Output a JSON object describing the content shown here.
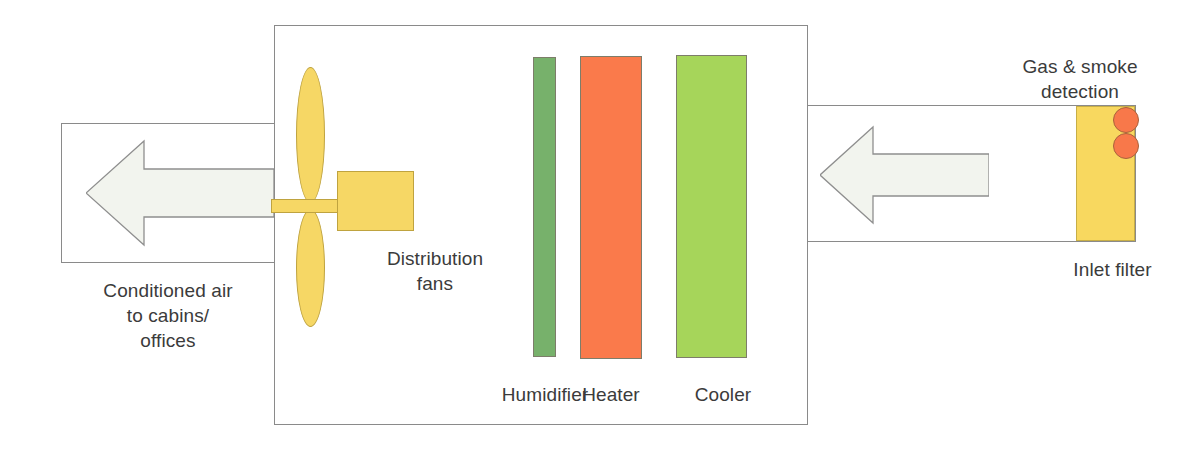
{
  "diagram": {
    "main_unit": {
      "name": "air-handling-unit"
    },
    "labels": {
      "conditioned_air": "Conditioned air\nto cabins/\noffices",
      "distribution_fans": "Distribution\nfans",
      "humidifier": "Humidifier",
      "heater": "Heater",
      "cooler": "Cooler",
      "gas_smoke_detection": "Gas & smoke\ndetection",
      "inlet_filter": "Inlet filter"
    },
    "components": [
      {
        "id": "outlet-duct",
        "label": "Conditioned air to cabins/offices",
        "flow": "left"
      },
      {
        "id": "distribution-fans",
        "label": "Distribution fans"
      },
      {
        "id": "humidifier",
        "label": "Humidifier",
        "color": "#77b16b"
      },
      {
        "id": "heater",
        "label": "Heater",
        "color": "#fa7a4b"
      },
      {
        "id": "cooler",
        "label": "Cooler",
        "color": "#a6d55a"
      },
      {
        "id": "inlet-filter",
        "label": "Inlet filter",
        "color": "#f8d85f"
      },
      {
        "id": "gas-smoke-detection",
        "label": "Gas & smoke detection",
        "color": "#f8784a",
        "count": 2
      },
      {
        "id": "inlet-duct",
        "label": "Inlet air duct",
        "flow": "left"
      }
    ],
    "colors": {
      "fan_yellow": "#f6d765",
      "filter_yellow": "#f8d85f",
      "humidifier_green": "#77b16b",
      "heater_orange": "#fa7a4b",
      "cooler_green": "#a6d55a",
      "detector_orange": "#f8784a",
      "arrow_fill": "#f2f4ee",
      "outline_grey": "#8a8a8a",
      "text_grey": "#3b3b3b"
    },
    "arrows": {
      "outlet_direction": "left",
      "inlet_direction": "left"
    }
  }
}
